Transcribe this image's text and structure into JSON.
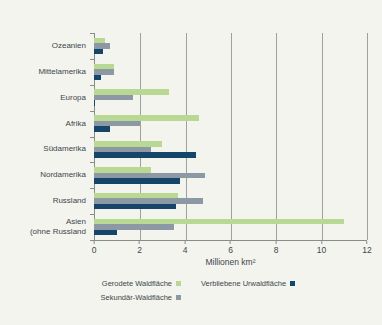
{
  "chart_data": {
    "type": "bar",
    "orientation": "horizontal",
    "categories": [
      "Ozeanien",
      "Mittelamerika",
      "Europa",
      "Afrika",
      "Südamerika",
      "Nordamerika",
      "Russland",
      "Asien\n(ohne Russland"
    ],
    "series": [
      {
        "name": "Gerodete Waldfläche",
        "color": "#b9d893",
        "values": [
          0.5,
          0.9,
          3.3,
          4.6,
          3.0,
          2.5,
          3.7,
          11.0
        ]
      },
      {
        "name": "Sekundär-Waldfläche",
        "color": "#8c99a5",
        "values": [
          0.7,
          0.9,
          1.7,
          2.0,
          2.5,
          4.9,
          4.8,
          3.5
        ]
      },
      {
        "name": "Verbliebene Urwaldfläche",
        "color": "#15466a",
        "values": [
          0.4,
          0.3,
          0.05,
          0.7,
          4.5,
          3.8,
          3.6,
          1.0
        ]
      }
    ],
    "legend_order": [
      0,
      2,
      1
    ],
    "xlabel": "Millionen km²",
    "xlim": [
      0,
      12
    ],
    "xticks": [
      0,
      2,
      4,
      6,
      8,
      10,
      12
    ],
    "grid": true,
    "legend_position": "bottom"
  },
  "colors": {
    "background": "#f3f4ee",
    "axis": "#878d89",
    "gridline": "#9ba19c",
    "text": "#3e464c"
  }
}
